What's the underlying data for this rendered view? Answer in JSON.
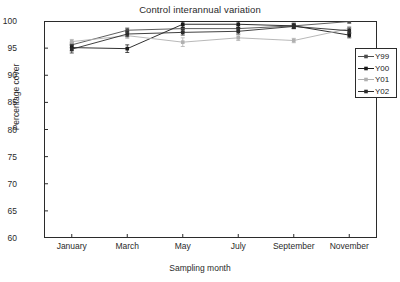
{
  "chart_data": {
    "type": "line",
    "title": "Control interannual variation",
    "xlabel": "Sampling month",
    "ylabel": "Percentage cover",
    "categories": [
      "January",
      "March",
      "May",
      "July",
      "September",
      "November"
    ],
    "ylim": [
      60,
      100
    ],
    "yticks": [
      60,
      65,
      70,
      75,
      80,
      85,
      90,
      95,
      100
    ],
    "grid": false,
    "legend_position": "right",
    "error_bars": true,
    "series": [
      {
        "name": "Y99",
        "color": "#4d4d4d",
        "values": [
          95.6,
          98.3,
          98.6,
          98.6,
          99.1,
          99.9
        ],
        "errors": [
          0.5,
          0.4,
          0.5,
          0.5,
          0.4,
          0.3
        ]
      },
      {
        "name": "Y00",
        "color": "#1a1a1a",
        "values": [
          95.1,
          94.9,
          99.4,
          99.4,
          99.1,
          97.4
        ],
        "errors": [
          0.6,
          0.7,
          0.6,
          0.6,
          0.5,
          0.5
        ]
      },
      {
        "name": "Y01",
        "color": "#b0b0b0",
        "values": [
          96.2,
          97.3,
          96.1,
          96.9,
          96.4,
          98.6
        ],
        "errors": [
          0.4,
          0.5,
          0.8,
          0.5,
          0.4,
          0.4
        ]
      },
      {
        "name": "Y02",
        "color": "#2b2b2b",
        "values": [
          94.8,
          97.6,
          97.9,
          98.1,
          99.0,
          98.2
        ],
        "errors": [
          0.7,
          0.5,
          0.5,
          0.5,
          0.4,
          0.5
        ]
      }
    ]
  }
}
